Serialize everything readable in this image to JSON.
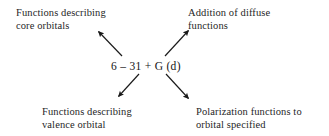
{
  "diagram": {
    "type": "annotated-callout",
    "background_color": "#ffffff",
    "text_color": "#1f1f1f",
    "center": {
      "name": "basis-set-notation",
      "text": "6 – 31 + G (d)"
    },
    "callouts": [
      {
        "id": "core",
        "position": "top-left",
        "lines": [
          "Functions describing",
          "core orbitals"
        ],
        "arrow": {
          "from": [
            122,
            56
          ],
          "to": [
            97,
            30
          ],
          "direction": "up-left"
        }
      },
      {
        "id": "diffuse",
        "position": "top-right",
        "lines": [
          "Addition of diffuse",
          "functions"
        ],
        "arrow": {
          "from": [
            165,
            56
          ],
          "to": [
            190,
            29
          ],
          "direction": "up-right"
        }
      },
      {
        "id": "valence",
        "position": "bottom-left",
        "lines": [
          "Functions describing",
          "valence orbital"
        ],
        "arrow": {
          "from": [
            139,
            74
          ],
          "to": [
            117,
            98
          ],
          "direction": "down-left"
        }
      },
      {
        "id": "polarization",
        "position": "bottom-right",
        "lines": [
          "Polarization functions to",
          "orbital specified"
        ],
        "arrow": {
          "from": [
            166,
            74
          ],
          "to": [
            190,
            100
          ],
          "direction": "down-right"
        }
      }
    ]
  }
}
